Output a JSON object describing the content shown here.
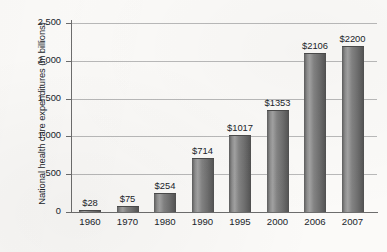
{
  "chart_data": {
    "type": "bar",
    "title": "",
    "subtitle": "",
    "xlabel": "",
    "ylabel": "National health care expenditures (in billions)",
    "categories": [
      "1960",
      "1970",
      "1980",
      "1990",
      "1995",
      "2000",
      "2006",
      "2007"
    ],
    "values": [
      28,
      75,
      254,
      714,
      1017,
      1353,
      2106,
      2200
    ],
    "data_labels": [
      "$28",
      "$75",
      "$254",
      "$714",
      "$1017",
      "$1353",
      "$2106",
      "$2200"
    ],
    "ylim": [
      0,
      2500
    ],
    "ytick_values": [
      0,
      500,
      1000,
      1500,
      2000,
      2500
    ],
    "ytick_labels": [
      "0",
      "500",
      "1,000",
      "1,500",
      "2,000",
      "2,500"
    ],
    "grid": true,
    "legend": false,
    "legend_position": "none",
    "bar_color": "#7b7b7b",
    "axis_color": "#6d6d6d",
    "gridline_color": "#b9b9b9",
    "text_color": "#20242a",
    "background_color": "#fbfaf8"
  }
}
